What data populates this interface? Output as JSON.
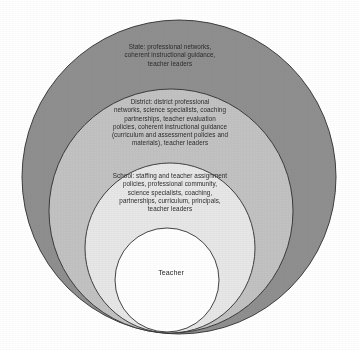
{
  "diagram": {
    "type": "nested-circles",
    "background_color": "#ffffff",
    "text_color": "#2b2b2b",
    "outline_color": "#2f2f2f",
    "rings": [
      {
        "id": "state",
        "name": "State",
        "level": 1,
        "fill_color": "#8f8f8f",
        "label": "State: professional networks,\ncoherent instructional guidance,\nteacher leaders",
        "cx": 179,
        "cy": 177,
        "r": 157
      },
      {
        "id": "district",
        "name": "District",
        "level": 2,
        "fill_color": "#c2c2c2",
        "label": "District: district professional\nnetworks, science specialists, coaching\npartnerships, teacher evaluation\npolicies, coherent instructional guidance\n(curriculum and assessment policies and\nmaterials), teacher leaders",
        "cx": 171,
        "cy": 211,
        "r": 122
      },
      {
        "id": "school",
        "name": "School",
        "level": 3,
        "fill_color": "#e7e7e7",
        "label": "School: staffing and teacher assignment\npolicies, professional community,\nscience specialists, coaching,\npartnerships, curriculum, principals,\nteacher leaders",
        "cx": 170,
        "cy": 248,
        "r": 85
      },
      {
        "id": "teacher",
        "name": "Teacher",
        "level": 4,
        "fill_color": "#ffffff",
        "label": "Teacher",
        "cx": 167,
        "cy": 280,
        "r": 52
      }
    ]
  }
}
